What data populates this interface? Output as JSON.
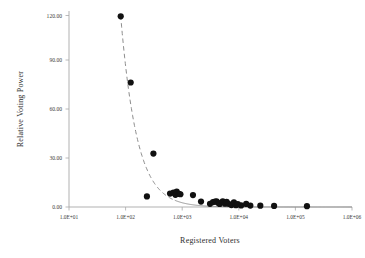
{
  "chart_data": {
    "type": "scatter",
    "title": "",
    "xlabel": "Registered Voters",
    "ylabel": "Relative Voting Power",
    "x_scale": "log",
    "y_scale": "linear",
    "xlim": [
      10,
      1000000
    ],
    "ylim": [
      0,
      120
    ],
    "grid": false,
    "legend": null,
    "x_tick_labels": [
      "1.0E+01",
      "1.0E+02",
      "1.0E+03",
      "1.0E+04",
      "1.0E+05",
      "1.0E+06"
    ],
    "x_tick_values": [
      10,
      100,
      1000,
      10000,
      100000,
      1000000
    ],
    "y_tick_labels": [
      "0.00",
      "30.00",
      "60.00",
      "90.00",
      "120.00"
    ],
    "y_tick_values": [
      0,
      30,
      60,
      90,
      120
    ],
    "series": [
      {
        "name": "Relative Voting Power",
        "marker": "filled-circle",
        "color": "#111111",
        "points": [
          {
            "x": 82,
            "y": 119.5
          },
          {
            "x": 123,
            "y": 78.0
          },
          {
            "x": 310,
            "y": 33.5
          },
          {
            "x": 238,
            "y": 6.6
          },
          {
            "x": 610,
            "y": 8.4
          },
          {
            "x": 700,
            "y": 9.0
          },
          {
            "x": 760,
            "y": 7.6
          },
          {
            "x": 800,
            "y": 9.6
          },
          {
            "x": 880,
            "y": 8.2
          },
          {
            "x": 930,
            "y": 8.0
          },
          {
            "x": 1550,
            "y": 7.5
          },
          {
            "x": 2150,
            "y": 3.4
          },
          {
            "x": 3100,
            "y": 2.0
          },
          {
            "x": 3500,
            "y": 3.1
          },
          {
            "x": 3800,
            "y": 3.4
          },
          {
            "x": 4050,
            "y": 3.6
          },
          {
            "x": 4300,
            "y": 2.6
          },
          {
            "x": 4600,
            "y": 1.9
          },
          {
            "x": 5200,
            "y": 3.5
          },
          {
            "x": 5700,
            "y": 2.1
          },
          {
            "x": 6100,
            "y": 3.2
          },
          {
            "x": 6600,
            "y": 2.0
          },
          {
            "x": 7400,
            "y": 1.2
          },
          {
            "x": 8200,
            "y": 2.9
          },
          {
            "x": 8900,
            "y": 1.1
          },
          {
            "x": 9600,
            "y": 1.8
          },
          {
            "x": 11000,
            "y": 1.0
          },
          {
            "x": 13500,
            "y": 1.9
          },
          {
            "x": 16000,
            "y": 0.9
          },
          {
            "x": 24000,
            "y": 0.8
          },
          {
            "x": 42000,
            "y": 0.7
          },
          {
            "x": 160000,
            "y": 0.5
          }
        ]
      }
    ],
    "trendline": {
      "style": "dashed-to-solid",
      "color": "#8d8d8d",
      "description": "power-law decay fit through the data"
    }
  },
  "axes": {
    "x_title": "Registered Voters",
    "y_title": "Relative Voting Power"
  }
}
